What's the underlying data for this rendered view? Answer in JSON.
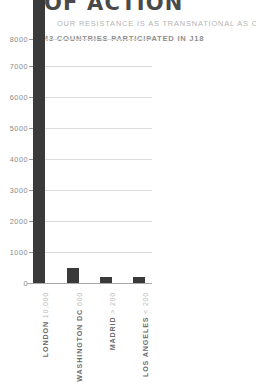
{
  "header": {
    "title": "OF ACTION",
    "subtitle": "OUR RESISTANCE IS AS TRANSNATIONAL AS CAPITAL",
    "stat": "43 COUNTRIES PARTICIPATED IN J18"
  },
  "colors": {
    "bar": "#3a3a3a",
    "grid": "#dcdcdc",
    "axis": "#a9a9a9",
    "title": "#4a4a4a",
    "subtitle": "#b4b4b4",
    "stat": "#8e8e8e",
    "tick_label": "#8a8a8a",
    "category_label": "#6d6d6d",
    "category_value": "#bdbdbd",
    "background": "#ffffff"
  },
  "chart_data": {
    "type": "bar",
    "title": "OF ACTION",
    "subtitle": "OUR RESISTANCE IS AS TRANSNATIONAL AS CAPITAL",
    "annotation": "43 COUNTRIES PARTICIPATED IN J18",
    "xlabel": "",
    "ylabel": "",
    "ylim": [
      0,
      8400
    ],
    "yticks": [
      0,
      1000,
      2000,
      3000,
      4000,
      5000,
      6000,
      7000,
      8000
    ],
    "ytick_labels": [
      "0",
      "1000",
      "2000",
      "3000",
      "4000",
      "5000",
      "6000",
      "7000",
      "8000"
    ],
    "grid": true,
    "legend": "none",
    "categories": [
      "LONDON",
      "WASHINGTON DC",
      "MADRID",
      "LOS ANGELES"
    ],
    "category_values": [
      "10,000",
      "600",
      "> 200",
      "< 200"
    ],
    "values": [
      10000,
      600,
      250,
      180
    ],
    "note": "London bar exceeds the visible axis range and is clipped at the top of the frame"
  },
  "yticks": [
    {
      "label": "8000",
      "top": 35
    },
    {
      "label": "7000",
      "top": 62
    },
    {
      "label": "6000",
      "top": 93
    },
    {
      "label": "5000",
      "top": 124
    },
    {
      "label": "4000",
      "top": 155
    },
    {
      "label": "3000",
      "top": 186
    },
    {
      "label": "2000",
      "top": 217
    },
    {
      "label": "1000",
      "top": 248
    },
    {
      "label": "0",
      "top": 279
    }
  ],
  "gridlines": [
    39,
    66,
    97,
    128,
    159,
    190,
    221,
    252
  ],
  "bars": [
    {
      "name": "london",
      "left": 33,
      "top": -9,
      "height": 292
    },
    {
      "name": "washington",
      "left": 67,
      "top": 268,
      "height": 15
    },
    {
      "name": "madrid",
      "left": 100,
      "top": 277,
      "height": 6
    },
    {
      "name": "los-angeles",
      "left": 133,
      "top": 277,
      "height": 6
    }
  ],
  "xticks": [
    {
      "label": "LONDON",
      "value": "10,000",
      "left": 33
    },
    {
      "label": "WASHINGTON DC",
      "value": "600",
      "left": 67
    },
    {
      "label": "MADRID",
      "value": "> 200",
      "left": 100
    },
    {
      "label": "LOS ANGELES",
      "value": "< 200",
      "left": 133
    }
  ]
}
